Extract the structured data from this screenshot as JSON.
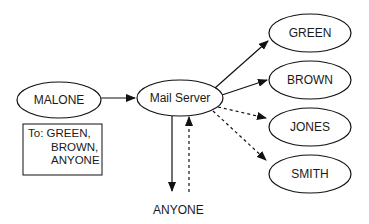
{
  "diagram": {
    "nodes": {
      "sender": {
        "label": "MALONE"
      },
      "server": {
        "label": "Mail Server"
      },
      "green": {
        "label": "GREEN"
      },
      "brown": {
        "label": "BROWN"
      },
      "jones": {
        "label": "JONES"
      },
      "smith": {
        "label": "SMITH"
      },
      "anyone": {
        "label": "ANYONE"
      }
    },
    "recipient_box": {
      "lines": [
        "To: GREEN,",
        "BROWN,",
        "ANYONE"
      ]
    },
    "edges": [
      {
        "from": "MALONE",
        "to": "Mail Server",
        "style": "solid"
      },
      {
        "from": "Mail Server",
        "to": "GREEN",
        "style": "solid"
      },
      {
        "from": "Mail Server",
        "to": "BROWN",
        "style": "solid"
      },
      {
        "from": "Mail Server",
        "to": "JONES",
        "style": "dashed"
      },
      {
        "from": "Mail Server",
        "to": "SMITH",
        "style": "dashed"
      },
      {
        "from": "Mail Server",
        "to": "ANYONE",
        "style": "solid"
      },
      {
        "from": "ANYONE",
        "to": "Mail Server",
        "style": "dashed"
      }
    ]
  }
}
